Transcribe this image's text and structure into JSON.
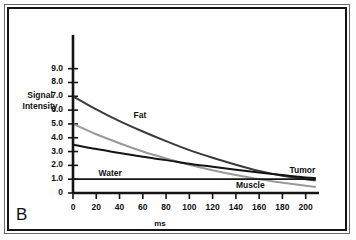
{
  "panel": {
    "label": "B"
  },
  "chart_data": {
    "type": "line",
    "title": "",
    "xlabel": "ms",
    "ylabel": "Signal Intensity",
    "xlim": [
      0,
      208
    ],
    "ylim": [
      0,
      9.7
    ],
    "grid": false,
    "legend": "inline-annotations",
    "xticks": [
      0,
      20,
      40,
      60,
      80,
      100,
      120,
      140,
      160,
      180,
      200
    ],
    "xticklabels": [
      "0",
      "20",
      "40",
      "60",
      "80",
      "100",
      "120",
      "140",
      "160",
      "180",
      "200"
    ],
    "yticks": [
      0,
      1.0,
      2.0,
      3.0,
      4.0,
      5.0,
      6.0,
      7.0,
      8.0,
      9.0
    ],
    "yticklabels": [
      "0",
      "1.0",
      "2.0",
      "3.0",
      "4.0",
      "5.0",
      "6.0",
      "7.0",
      "8.0",
      "9.0"
    ],
    "series": [
      {
        "name": "Fat",
        "color": "#3a3a3a",
        "label_x": 52,
        "label_y": 5.55,
        "x": [
          0,
          20,
          40,
          60,
          80,
          100,
          120,
          140,
          160,
          180,
          200,
          208
        ],
        "y": [
          7.0,
          6.05,
          5.2,
          4.45,
          3.75,
          3.1,
          2.55,
          2.05,
          1.6,
          1.25,
          1.0,
          0.92
        ]
      },
      {
        "name": "Muscle",
        "color": "#9a9a9a",
        "label_x": 140,
        "label_y": 0.52,
        "x": [
          0,
          20,
          40,
          60,
          80,
          100,
          120,
          140,
          160,
          180,
          200,
          208
        ],
        "y": [
          5.0,
          4.25,
          3.6,
          3.0,
          2.5,
          2.05,
          1.65,
          1.3,
          1.0,
          0.75,
          0.52,
          0.45
        ]
      },
      {
        "name": "Tumor",
        "color": "#141414",
        "label_x": 186,
        "label_y": 1.62,
        "x": [
          0,
          20,
          40,
          60,
          80,
          100,
          120,
          140,
          160,
          180,
          200,
          208
        ],
        "y": [
          3.5,
          3.18,
          2.9,
          2.62,
          2.38,
          2.12,
          1.9,
          1.68,
          1.48,
          1.3,
          1.12,
          1.08
        ]
      },
      {
        "name": "Water",
        "color": "#141414",
        "label_x": 22,
        "label_y": 1.38,
        "x": [
          0,
          208
        ],
        "y": [
          1.0,
          1.0
        ]
      }
    ]
  }
}
